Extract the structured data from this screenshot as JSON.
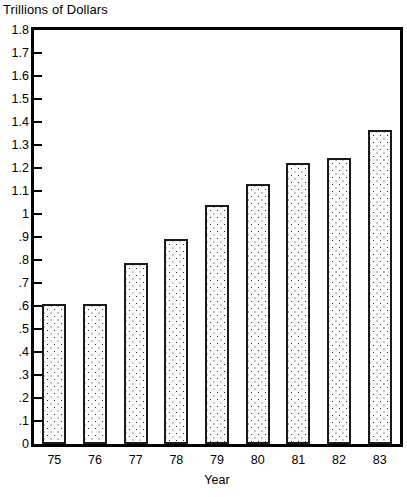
{
  "chart_data": {
    "type": "bar",
    "title": "",
    "ylabel": "Trillions of Dollars",
    "xlabel": "Year",
    "categories": [
      "75",
      "76",
      "77",
      "78",
      "79",
      "80",
      "81",
      "82",
      "83"
    ],
    "values": [
      0.61,
      0.61,
      0.785,
      0.89,
      1.04,
      1.13,
      1.22,
      1.245,
      1.365
    ],
    "ylim": [
      0,
      1.8
    ],
    "ytick_labels": [
      "1.8",
      "1.7",
      "1.6",
      "1.5",
      "1.4",
      "1.3",
      "1.2",
      "1.1",
      "1",
      ".9",
      ".8",
      ".7",
      ".6",
      ".5",
      ".4",
      ".3",
      ".2",
      ".1",
      "0"
    ],
    "ytick_values": [
      1.8,
      1.7,
      1.6,
      1.5,
      1.4,
      1.3,
      1.2,
      1.1,
      1.0,
      0.9,
      0.8,
      0.7,
      0.6,
      0.5,
      0.4,
      0.3,
      0.2,
      0.1,
      0.0
    ],
    "grid": false,
    "legend": false,
    "bar_fill": "#fdfdfd",
    "bar_edge_color": "#1a1a1a",
    "frame_color": "#000000",
    "background": "#ffffff"
  }
}
